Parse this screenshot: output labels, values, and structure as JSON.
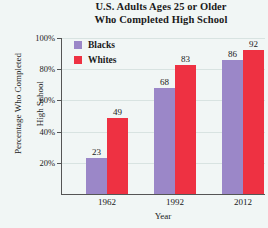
{
  "chart_data": {
    "type": "bar",
    "title": "U.S. Adults Ages 25 or Older\nWho Completed High School",
    "title_line1": "U.S. Adults Ages 25 or Older",
    "title_line2": "Who Completed High School",
    "xlabel": "Year",
    "ylabel": "Percentage Who Completed\nHigh School",
    "ylabel_line1": "Percentage Who Completed",
    "ylabel_line2": "High School",
    "categories": [
      "1962",
      "1992",
      "2012"
    ],
    "ylim": [
      0,
      100
    ],
    "yticks": [
      "20%",
      "40%",
      "60%",
      "80%",
      "100%"
    ],
    "ytick_values": [
      20,
      40,
      60,
      80,
      100
    ],
    "grid": true,
    "legend_position": "upper-left-inside",
    "series": [
      {
        "name": "Blacks",
        "color": "#9b87c8",
        "values": [
          23,
          68,
          86
        ],
        "labels": [
          "23",
          "68",
          "86"
        ]
      },
      {
        "name": "Whites",
        "color": "#ee3142",
        "values": [
          49,
          83,
          92
        ],
        "labels": [
          "49",
          "83",
          "92"
        ]
      }
    ]
  },
  "legend": {
    "items": [
      {
        "label": "Blacks",
        "swatch": "legend-swatch-blacks"
      },
      {
        "label": "Whites",
        "swatch": "legend-swatch-whites"
      }
    ]
  }
}
